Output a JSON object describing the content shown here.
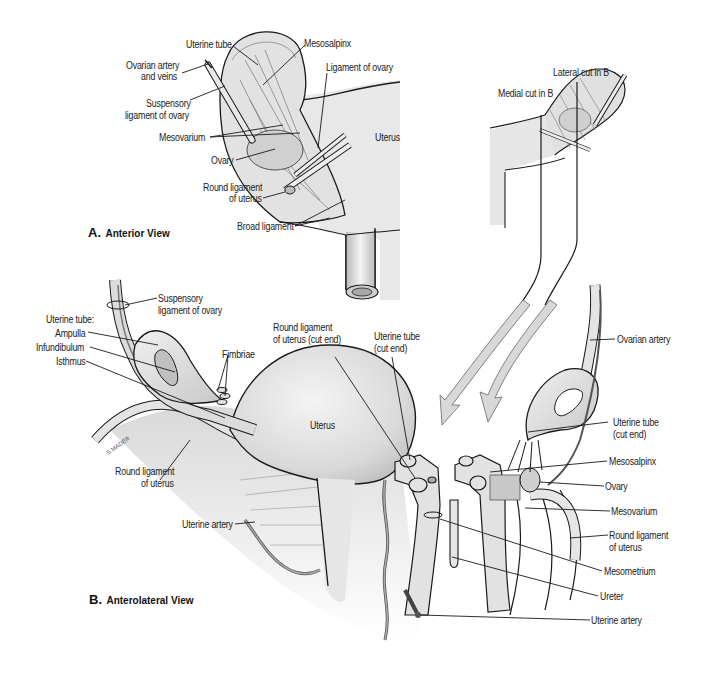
{
  "figure": {
    "panels": [
      {
        "letter": "A.",
        "title": "Anterior View"
      },
      {
        "letter": "B.",
        "title": "Anterolateral View"
      }
    ],
    "panel_a_labels": {
      "uterine_tube": "Uterine tube",
      "mesosalpinx": "Mesosalpinx",
      "ovarian_artery": "Ovarian artery",
      "and_veins": "and veins",
      "ligament_of_ovary": "Ligament of ovary",
      "suspensory_1": "Suspensory",
      "suspensory_2": "ligament of ovary",
      "mesovarium": "Mesovarium",
      "uterus": "Uterus",
      "ovary": "Ovary",
      "round_lig_1": "Round ligament",
      "round_lig_2": "of uterus",
      "broad_ligament": "Broad ligament"
    },
    "inset_labels": {
      "lateral_cut": "Lateral cut in B",
      "medial_cut": "Medial cut in B"
    },
    "panel_b_labels": {
      "suspensory_1": "Suspensory",
      "suspensory_2": "ligament of ovary",
      "uterine_tube_heading": "Uterine tube:",
      "ampulla": "Ampulla",
      "infundibulum": "Infundibulum",
      "isthmus": "Isthmus",
      "fimbriae": "Fimbriae",
      "round_lig_cut_1": "Round ligament",
      "round_lig_cut_2": "of uterus (cut end)",
      "uterine_tube_cut_1": "Uterine tube",
      "uterine_tube_cut_2": "(cut end)",
      "uterus": "Uterus",
      "round_lig_1": "Round ligament",
      "round_lig_2": "of uterus",
      "uterine_artery_left": "Uterine artery",
      "ovarian_artery": "Ovarian artery",
      "uterine_tube_right_1": "Uterine tube",
      "uterine_tube_right_2": "(cut end)",
      "mesosalpinx": "Mesosalpinx",
      "ovary": "Ovary",
      "mesovarium": "Mesovarium",
      "round_lig_right_1": "Round ligament",
      "round_lig_right_2": "of uterus",
      "mesometrium": "Mesometrium",
      "ureter": "Ureter",
      "uterine_artery_bottom": "Uterine artery"
    },
    "artist_signature": "S.MADER",
    "colors": {
      "tissue_fill": "#e4e4e4",
      "tissue_light": "#f2f2f2",
      "outline": "#1a1a1a",
      "arrow_fill": "#d8d8d8",
      "text": "#222222"
    }
  }
}
